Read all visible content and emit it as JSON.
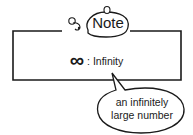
{
  "note": {
    "title": "Note",
    "icon": "paperclip-icon"
  },
  "definition": {
    "symbol": "∞",
    "separator": ":",
    "term": "Infinity"
  },
  "callout": {
    "line1": "an infinitely",
    "line2": "large number"
  },
  "colors": {
    "stroke": "#1a1a1a",
    "background": "#ffffff"
  }
}
